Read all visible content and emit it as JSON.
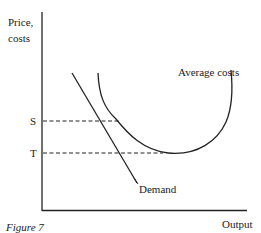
{
  "diagram": {
    "y_axis_label_line1": "Price,",
    "y_axis_label_line2": "costs",
    "x_axis_label": "Output",
    "caption": "Figure 7",
    "price_levels": [
      {
        "name": "S"
      },
      {
        "name": "T"
      }
    ],
    "curves": {
      "average_costs": "Average costs",
      "demand": "Demand"
    },
    "colors": {
      "line": "#222222",
      "background": "#ffffff"
    }
  }
}
